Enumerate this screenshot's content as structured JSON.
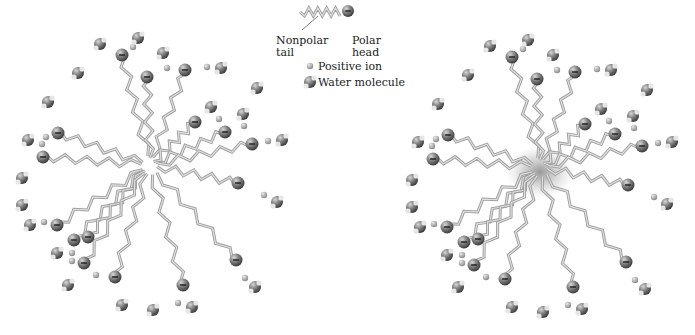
{
  "legend": {
    "nonpolar_tail": "Nonpolar\ntail",
    "polar_head": "Polar\nhead",
    "positive_ion": "Positive ion",
    "water_molecule": "Water molecule"
  },
  "colors": {
    "tail": "#b5b5b5",
    "head": "#6f6f6f",
    "ion": "#a9a9a9",
    "water": "#7a7a7a",
    "core_shade": "#9a9a9a"
  },
  "micelles": [
    {
      "name": "micelle-left",
      "center": [
        150,
        165
      ],
      "shaded_core": false
    },
    {
      "name": "micelle-right",
      "center": [
        540,
        167
      ],
      "shaded_core": true
    }
  ],
  "heads": [
    [
      122,
      55
    ],
    [
      147,
      77
    ],
    [
      185,
      70
    ],
    [
      195,
      122
    ],
    [
      225,
      132
    ],
    [
      252,
      144
    ],
    [
      238,
      183
    ],
    [
      58,
      133
    ],
    [
      43,
      157
    ],
    [
      57,
      225
    ],
    [
      74,
      240
    ],
    [
      88,
      237
    ],
    [
      84,
      263
    ],
    [
      115,
      277
    ],
    [
      183,
      285
    ],
    [
      236,
      260
    ]
  ],
  "waters": [
    [
      100,
      44
    ],
    [
      138,
      38
    ],
    [
      163,
      53
    ],
    [
      78,
      73
    ],
    [
      48,
      102
    ],
    [
      221,
      68
    ],
    [
      257,
      88
    ],
    [
      211,
      107
    ],
    [
      243,
      114
    ],
    [
      28,
      140
    ],
    [
      282,
      140
    ],
    [
      22,
      178
    ],
    [
      22,
      205
    ],
    [
      277,
      202
    ],
    [
      30,
      225
    ],
    [
      57,
      253
    ],
    [
      68,
      285
    ],
    [
      255,
      287
    ],
    [
      122,
      305
    ],
    [
      153,
      310
    ],
    [
      192,
      307
    ]
  ],
  "ions": [
    [
      133,
      47
    ],
    [
      167,
      68
    ],
    [
      207,
      67
    ],
    [
      219,
      119
    ],
    [
      244,
      126
    ],
    [
      268,
      141
    ],
    [
      46,
      137
    ],
    [
      42,
      144
    ],
    [
      264,
      195
    ],
    [
      44,
      222
    ],
    [
      72,
      253
    ],
    [
      72,
      261
    ],
    [
      96,
      275
    ],
    [
      245,
      278
    ],
    [
      178,
      303
    ]
  ]
}
